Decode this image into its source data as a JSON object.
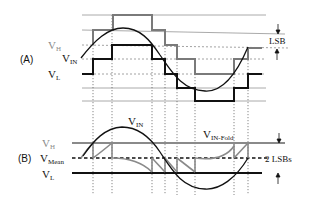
{
  "panel_a": {
    "tag": "(A)",
    "labels": {
      "vh": "V",
      "vh_sub": "H",
      "vin": "V",
      "vin_sub": "IN",
      "vl": "V",
      "vl_sub": "L"
    },
    "annotation": "LSB"
  },
  "panel_b": {
    "tag": "(B)",
    "labels": {
      "vh": "V",
      "vh_sub": "H",
      "vmean": "V",
      "vmean_sub": "Mean",
      "vl": "V",
      "vl_sub": "L",
      "vin": "V",
      "vin_sub": "IN",
      "vin_fold": "V",
      "vin_fold_sub": "IN-Fold"
    },
    "annotation": "2 LSBs"
  },
  "colors": {
    "grid_solid": "#9a9a9a",
    "grid_dashed": "#8a8a8a",
    "quantizer_high": "#7a7a7a",
    "quantizer_low": "#111111",
    "signal": "#111111",
    "dotted_vertical": "#555555",
    "label_grey": "#8a8a8a",
    "label_dark": "#111111",
    "mean_dashed": "#111111",
    "fold_segments": "#8a8a8a"
  }
}
